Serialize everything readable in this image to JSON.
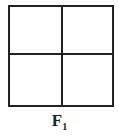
{
  "diagram": {
    "label_main": "F",
    "label_sub": "1",
    "grid": {
      "rows": 2,
      "cols": 2
    },
    "line_color": "#222222"
  }
}
